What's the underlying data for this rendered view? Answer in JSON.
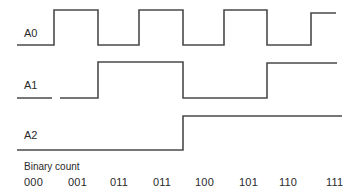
{
  "diagram": {
    "type": "timing-diagram",
    "stroke_color": "#4a4a4a",
    "signals": [
      {
        "name": "A0",
        "label_pos": [
          24,
          27
        ],
        "points": "17,45 54,45 54,10 98,10 98,45 139,45 139,10 183,10 183,45 224,45 224,10 267,10 267,45 311,45 311,13 336,13"
      },
      {
        "name": "A1",
        "label_pos": [
          24,
          79
        ],
        "points_segments": [
          "17,98 52,98",
          "60,98 98,98 98,62 183,62 183,98 267,98 267,63 337,63"
        ]
      },
      {
        "name": "A2",
        "label_pos": [
          24,
          129
        ],
        "points": "17,150 183,150 183,116 342,116"
      }
    ],
    "binary_count_label": "Binary count",
    "binary_counts": [
      {
        "value": "000",
        "x": 24
      },
      {
        "value": "001",
        "x": 68
      },
      {
        "value": "011",
        "x": 110
      },
      {
        "value": "011",
        "x": 153
      },
      {
        "value": "100",
        "x": 195
      },
      {
        "value": "101",
        "x": 239
      },
      {
        "value": "110",
        "x": 279
      },
      {
        "value": "111",
        "x": 326
      }
    ]
  }
}
